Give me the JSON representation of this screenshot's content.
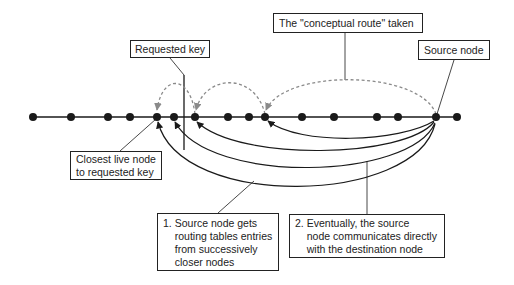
{
  "diagram": {
    "colors": {
      "line": "#1a1a1a",
      "node": "#1a1a1a",
      "dashed_arc": "#8a8a8a",
      "box_border": "#222222",
      "text": "#222222"
    },
    "ring_axis": {
      "y": 117,
      "x_start": 33,
      "x_end": 457
    },
    "nodes_x": [
      33,
      71,
      108,
      130,
      157,
      174,
      195,
      228,
      249,
      265,
      302,
      334,
      377,
      398,
      436,
      457
    ],
    "source_node_x": 436,
    "closest_node_x": 157,
    "requested_key_marker": {
      "x": 184,
      "y_top": 75,
      "y_bottom": 150
    },
    "labels": {
      "requested_key": "Requested key",
      "conceptual_route": "The \"conceptual route\" taken",
      "source_node": "Source node",
      "closest_live_node": "Closest live node\nto requested key",
      "step1_num": "1.",
      "step1_text": "Source node gets\nrouting tables entries\nfrom successively\ncloser nodes",
      "step2_num": "2.",
      "step2_text": "Eventually, the source\nnode communicates directly\nwith the destination node"
    },
    "dashed_hops": [
      {
        "from_x": 436,
        "to_x": 265,
        "peak_y": 80
      },
      {
        "from_x": 265,
        "to_x": 195,
        "peak_y": 84
      },
      {
        "from_x": 195,
        "to_x": 157,
        "peak_y": 85
      }
    ],
    "solid_routes": [
      {
        "from_x": 436,
        "to_x": 265,
        "low_y": 140
      },
      {
        "from_x": 436,
        "to_x": 195,
        "low_y": 152
      },
      {
        "from_x": 436,
        "to_x": 174,
        "low_y": 167
      },
      {
        "from_x": 436,
        "to_x": 157,
        "low_y": 187
      }
    ]
  }
}
